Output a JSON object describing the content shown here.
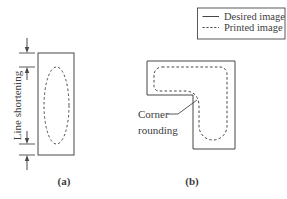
{
  "figure": {
    "legend": {
      "items": [
        {
          "label": "Desired image",
          "line_style": "solid"
        },
        {
          "label": "Printed image",
          "line_style": "dashed"
        }
      ]
    },
    "panel_a": {
      "caption": "(a)",
      "annotation": "Line shortening"
    },
    "panel_b": {
      "caption": "(b)",
      "annotation_lines": [
        "Corner",
        "rounding"
      ]
    },
    "colors": {
      "stroke-color": "#474747",
      "text-color": "#3d3d3d",
      "background-color": "#ffffff"
    }
  }
}
